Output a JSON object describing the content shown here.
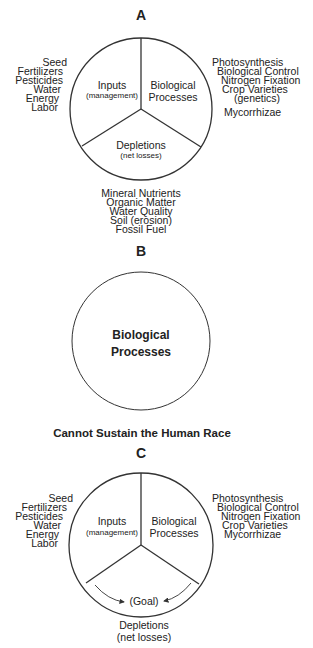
{
  "colors": {
    "stroke": "#333333",
    "text": "#222222",
    "background": "#ffffff"
  },
  "panel_a": {
    "label": "A",
    "sectors": {
      "inputs": {
        "title": "Inputs",
        "subtitle": "(management)"
      },
      "biological": {
        "line1": "Biological",
        "line2": "Processes"
      },
      "depletions": {
        "title": "Depletions",
        "subtitle": "(net losses)"
      }
    },
    "inputs_list": [
      "Seed",
      "Fertilizers",
      "Pesticides",
      "Water",
      "Energy",
      "Labor"
    ],
    "biological_list": [
      "Photosynthesis",
      "Biological Control",
      "Nitrogen Fixation",
      "Crop Varieties",
      "(genetics)",
      "Mycorrhizae"
    ],
    "depletions_list": [
      "Mineral Nutrients",
      "Organic Matter",
      "Water Quality",
      "Soil (erosion)",
      "Fossil Fuel"
    ]
  },
  "panel_b": {
    "label": "B",
    "circle": {
      "line1": "Biological",
      "line2": "Processes"
    },
    "caption": "Cannot Sustain the Human Race"
  },
  "panel_c": {
    "label": "C",
    "sectors": {
      "inputs": {
        "title": "Inputs",
        "subtitle": "(management)"
      },
      "biological": {
        "line1": "Biological",
        "line2": "Processes"
      },
      "goal": "(Goal)"
    },
    "depletions": {
      "title": "Depletions",
      "subtitle": "(net losses)"
    },
    "inputs_list": [
      "Seed",
      "Fertilizers",
      "Pesticides",
      "Water",
      "Energy",
      "Labor"
    ],
    "biological_list": [
      "Photosynthesis",
      "Biological Control",
      "Nitrogen Fixation",
      "Crop Varieties",
      "Mycorrhizae"
    ]
  }
}
